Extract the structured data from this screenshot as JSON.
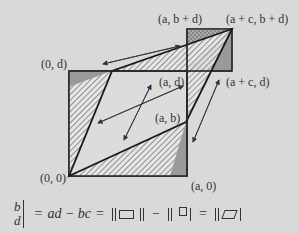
{
  "diagram": {
    "labels": {
      "origin": "(0, 0)",
      "a0": "(a, 0)",
      "ab": "(a, b)",
      "ad": "(a, d)",
      "zero_d": "(0, d)",
      "a_bd": "(a, b + d)",
      "ac_bd": "(a + c, b + d)",
      "ac_d": "(a + c, d)"
    },
    "colors": {
      "background": "#d9d9d9",
      "stroke": "#2a2a2a",
      "dark_fill": "#9a9a9a",
      "hatch": "#555555"
    }
  },
  "formula": {
    "matrix_top": "b",
    "matrix_bottom": "d",
    "equals1": "=",
    "expr": "ad − bc",
    "equals2": "=",
    "minus": "−",
    "equals3": "="
  }
}
